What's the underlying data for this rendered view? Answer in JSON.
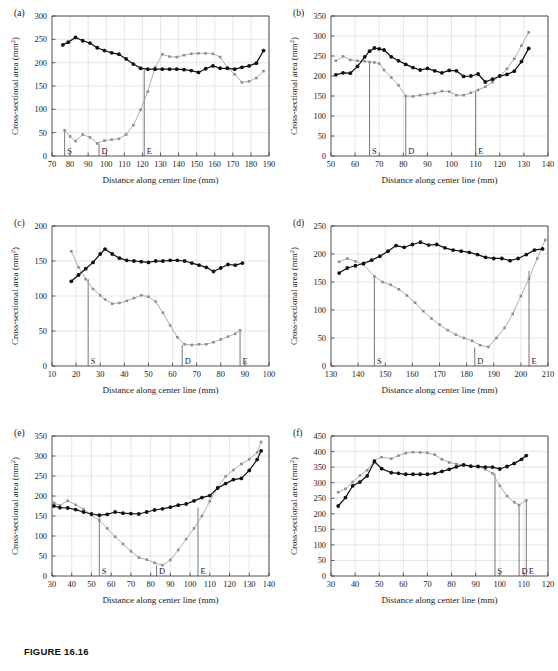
{
  "figure": {
    "caption": "FIGURE 16.16",
    "axis_x_title": "Distance along center line (mm)",
    "axis_y_title": "Cross-sectional area (mm",
    "axis_y_title_sup": "2",
    "axis_y_title_tail": ")",
    "colors": {
      "series_black": "#111111",
      "series_gray": "#8f8f8f",
      "axis": "#3c3c3c",
      "grid": "#c8c8c8"
    }
  },
  "chart_data": [
    {
      "type": "line",
      "panel": "(a)",
      "title": "",
      "xlabel": "Distance along center line (mm)",
      "ylabel": "Cross-sectional area (mm2)",
      "xlim": [
        70,
        190
      ],
      "ylim": [
        0,
        300
      ],
      "xticks": [
        70,
        80,
        90,
        100,
        110,
        120,
        130,
        140,
        150,
        160,
        170,
        180,
        190
      ],
      "yticks": [
        0,
        50,
        100,
        150,
        200,
        250,
        300
      ],
      "grid": true,
      "legend": "none",
      "markers": [
        {
          "label": "S",
          "x": 77,
          "y_top": 55
        },
        {
          "label": "D",
          "x": 96,
          "y_top": 27
        },
        {
          "label": "E",
          "x": 121,
          "y_top": 185
        }
      ],
      "series": [
        {
          "name": "black",
          "x": [
            76,
            79,
            83,
            87,
            91,
            95,
            99,
            103,
            107,
            111,
            115,
            119,
            123,
            127,
            131,
            135,
            139,
            143,
            147,
            151,
            155,
            159,
            163,
            167,
            171,
            175,
            179,
            183,
            187
          ],
          "values": [
            238,
            244,
            254,
            247,
            242,
            232,
            226,
            221,
            218,
            208,
            197,
            188,
            186,
            186,
            186,
            186,
            186,
            185,
            183,
            179,
            187,
            193,
            188,
            188,
            186,
            190,
            193,
            199,
            226
          ]
        },
        {
          "name": "gray",
          "x": [
            77,
            80,
            83,
            87,
            91,
            95,
            99,
            103,
            107,
            111,
            115,
            119,
            123,
            127,
            131,
            135,
            139,
            143,
            147,
            151,
            155,
            159,
            163,
            167,
            171,
            175,
            179,
            183,
            187
          ],
          "values": [
            55,
            42,
            32,
            46,
            40,
            27,
            33,
            35,
            37,
            46,
            66,
            99,
            138,
            190,
            218,
            213,
            212,
            216,
            219,
            220,
            220,
            219,
            212,
            189,
            175,
            158,
            160,
            167,
            182
          ]
        }
      ]
    },
    {
      "type": "line",
      "panel": "(b)",
      "title": "",
      "xlabel": "Distance along center line (mm)",
      "ylabel": "Cross-sectional area (mm2)",
      "xlim": [
        50,
        140
      ],
      "ylim": [
        0,
        350
      ],
      "xticks": [
        50,
        60,
        70,
        80,
        90,
        100,
        110,
        120,
        130,
        140
      ],
      "yticks": [
        0,
        50,
        100,
        150,
        200,
        250,
        300,
        350
      ],
      "grid": true,
      "legend": "none",
      "markers": [
        {
          "label": "S",
          "x": 66,
          "y_top": 236
        },
        {
          "label": "D",
          "x": 81,
          "y_top": 150
        },
        {
          "label": "E",
          "x": 110,
          "y_top": 163
        }
      ],
      "series": [
        {
          "name": "black",
          "x": [
            52,
            55,
            58,
            61,
            64,
            66,
            68,
            70,
            72,
            75,
            78,
            81,
            84,
            87,
            90,
            93,
            96,
            99,
            102,
            105,
            108,
            111,
            114,
            117,
            120,
            123,
            126,
            129,
            132
          ],
          "values": [
            203,
            208,
            207,
            224,
            248,
            262,
            270,
            268,
            265,
            248,
            238,
            229,
            221,
            215,
            219,
            213,
            208,
            214,
            213,
            199,
            200,
            205,
            185,
            192,
            200,
            204,
            212,
            236,
            269
          ]
        },
        {
          "name": "gray",
          "x": [
            52,
            55,
            58,
            61,
            64,
            66,
            68,
            70,
            72,
            75,
            78,
            81,
            84,
            87,
            90,
            93,
            96,
            99,
            102,
            105,
            108,
            111,
            114,
            117,
            120,
            123,
            126,
            129,
            132
          ],
          "values": [
            238,
            249,
            240,
            238,
            237,
            235,
            234,
            231,
            215,
            196,
            177,
            150,
            149,
            152,
            155,
            157,
            162,
            161,
            152,
            152,
            158,
            165,
            173,
            185,
            200,
            218,
            243,
            276,
            309
          ]
        }
      ]
    },
    {
      "type": "line",
      "panel": "(c)",
      "title": "",
      "xlabel": "Distance along center line (mm)",
      "ylabel": "Cross-sectional area (mm2)",
      "xlim": [
        10,
        100
      ],
      "ylim": [
        0,
        200
      ],
      "xticks": [
        10,
        20,
        30,
        40,
        50,
        60,
        70,
        80,
        90,
        100
      ],
      "yticks": [
        0,
        50,
        100,
        150,
        200
      ],
      "grid": true,
      "legend": "none",
      "markers": [
        {
          "label": "S",
          "x": 25,
          "y_top": 124
        },
        {
          "label": "D",
          "x": 64,
          "y_top": 30
        },
        {
          "label": "E",
          "x": 88,
          "y_top": 51
        }
      ],
      "series": [
        {
          "name": "black",
          "x": [
            18,
            21,
            24,
            27,
            30,
            32,
            35,
            38,
            41,
            44,
            47,
            50,
            53,
            56,
            59,
            62,
            65,
            68,
            71,
            74,
            77,
            80,
            83,
            86,
            89
          ],
          "values": [
            121,
            130,
            139,
            148,
            160,
            167,
            160,
            154,
            151,
            150,
            149,
            148,
            150,
            150,
            151,
            151,
            150,
            147,
            144,
            141,
            135,
            140,
            145,
            144,
            147
          ]
        },
        {
          "name": "gray",
          "x": [
            18,
            21,
            24,
            27,
            30,
            32,
            35,
            38,
            41,
            44,
            47,
            50,
            53,
            56,
            59,
            62,
            65,
            68,
            71,
            74,
            77,
            80,
            83,
            86,
            88
          ],
          "values": [
            164,
            141,
            124,
            110,
            101,
            95,
            89,
            90,
            93,
            97,
            101,
            99,
            92,
            76,
            58,
            41,
            31,
            30,
            31,
            31,
            34,
            38,
            42,
            46,
            51
          ]
        }
      ]
    },
    {
      "type": "line",
      "panel": "(d)",
      "title": "",
      "xlabel": "Distance along center line (mm)",
      "ylabel": "Cross-sectional area (mm2)",
      "xlim": [
        130,
        210
      ],
      "ylim": [
        0,
        250
      ],
      "xticks": [
        130,
        140,
        150,
        160,
        170,
        180,
        190,
        200,
        210
      ],
      "yticks": [
        0,
        50,
        100,
        150,
        200,
        250
      ],
      "grid": true,
      "legend": "none",
      "markers": [
        {
          "label": "S",
          "x": 146,
          "y_top": 160
        },
        {
          "label": "D",
          "x": 183,
          "y_top": 33
        },
        {
          "label": "E",
          "x": 203,
          "y_top": 170
        }
      ],
      "series": [
        {
          "name": "black",
          "x": [
            133,
            136,
            139,
            142,
            145,
            148,
            151,
            154,
            157,
            160,
            163,
            166,
            169,
            172,
            175,
            178,
            181,
            184,
            187,
            190,
            193,
            196,
            199,
            202,
            205,
            208
          ],
          "values": [
            166,
            175,
            179,
            183,
            189,
            196,
            205,
            215,
            212,
            217,
            221,
            216,
            217,
            211,
            207,
            205,
            203,
            199,
            194,
            192,
            192,
            188,
            192,
            199,
            207,
            209
          ]
        },
        {
          "name": "gray",
          "x": [
            133,
            136,
            139,
            142,
            146,
            149,
            152,
            155,
            158,
            161,
            164,
            167,
            170,
            173,
            176,
            179,
            182,
            185,
            188,
            191,
            194,
            197,
            200,
            203,
            206,
            209
          ],
          "values": [
            186,
            192,
            187,
            181,
            160,
            150,
            145,
            137,
            126,
            113,
            98,
            85,
            74,
            64,
            56,
            50,
            45,
            37,
            34,
            50,
            68,
            93,
            125,
            156,
            192,
            225
          ]
        }
      ]
    },
    {
      "type": "line",
      "panel": "(e)",
      "title": "",
      "xlabel": "Distance along center line (mm)",
      "ylabel": "Cross-sectional area (mm2)",
      "xlim": [
        30,
        140
      ],
      "ylim": [
        0,
        350
      ],
      "xticks": [
        30,
        40,
        50,
        60,
        70,
        80,
        90,
        100,
        110,
        120,
        130,
        140
      ],
      "yticks": [
        0,
        50,
        100,
        150,
        200,
        250,
        300,
        350
      ],
      "grid": true,
      "legend": "none",
      "markers": [
        {
          "label": "S",
          "x": 54,
          "y_top": 152
        },
        {
          "label": "D",
          "x": 83,
          "y_top": 27
        },
        {
          "label": "E",
          "x": 104,
          "y_top": 171
        }
      ],
      "series": [
        {
          "name": "black",
          "x": [
            31,
            34,
            38,
            42,
            46,
            50,
            54,
            58,
            62,
            66,
            70,
            74,
            78,
            82,
            86,
            90,
            94,
            98,
            102,
            106,
            110,
            114,
            118,
            122,
            126,
            130,
            134,
            136
          ],
          "values": [
            175,
            171,
            170,
            166,
            160,
            155,
            152,
            154,
            160,
            157,
            156,
            155,
            160,
            165,
            168,
            172,
            177,
            180,
            188,
            196,
            201,
            220,
            231,
            241,
            244,
            264,
            291,
            313
          ]
        },
        {
          "name": "gray",
          "x": [
            31,
            34,
            38,
            42,
            46,
            50,
            54,
            58,
            62,
            66,
            70,
            74,
            78,
            82,
            86,
            90,
            94,
            98,
            102,
            106,
            110,
            114,
            118,
            122,
            126,
            130,
            134,
            136
          ],
          "values": [
            183,
            176,
            188,
            178,
            167,
            152,
            139,
            119,
            98,
            80,
            62,
            46,
            41,
            33,
            27,
            40,
            65,
            92,
            119,
            150,
            187,
            222,
            249,
            265,
            280,
            292,
            309,
            335
          ]
        }
      ]
    },
    {
      "type": "line",
      "panel": "(f)",
      "title": "",
      "xlabel": "Distance along center line (mm)",
      "ylabel": "Cross-sectional area (mm2)",
      "xlim": [
        30,
        120
      ],
      "ylim": [
        0,
        450
      ],
      "xticks": [
        30,
        40,
        50,
        60,
        70,
        80,
        90,
        100,
        110,
        120
      ],
      "yticks": [
        0,
        50,
        100,
        150,
        200,
        250,
        300,
        350,
        400,
        450
      ],
      "grid": true,
      "legend": "none",
      "markers": [
        {
          "label": "S",
          "x": 98,
          "y_top": 330
        },
        {
          "label": "D",
          "x": 108,
          "y_top": 228
        },
        {
          "label": "E",
          "x": 111,
          "y_top": 243
        }
      ],
      "series": [
        {
          "name": "black",
          "x": [
            33,
            36,
            39,
            42,
            45,
            48,
            51,
            55,
            58,
            61,
            64,
            67,
            70,
            73,
            76,
            79,
            82,
            85,
            88,
            91,
            94,
            97,
            100,
            103,
            106,
            109,
            111
          ],
          "values": [
            225,
            252,
            290,
            302,
            322,
            368,
            345,
            332,
            330,
            327,
            327,
            327,
            327,
            330,
            336,
            343,
            351,
            357,
            353,
            352,
            350,
            350,
            344,
            352,
            362,
            375,
            387
          ]
        },
        {
          "name": "gray",
          "x": [
            33,
            36,
            39,
            42,
            45,
            48,
            51,
            55,
            58,
            61,
            64,
            67,
            70,
            73,
            76,
            79,
            82,
            85,
            88,
            91,
            94,
            97,
            100,
            103,
            106,
            108,
            111
          ],
          "values": [
            269,
            280,
            302,
            323,
            340,
            372,
            382,
            377,
            387,
            395,
            398,
            397,
            396,
            390,
            375,
            365,
            360,
            357,
            352,
            351,
            343,
            330,
            290,
            257,
            237,
            228,
            243
          ]
        }
      ]
    }
  ]
}
